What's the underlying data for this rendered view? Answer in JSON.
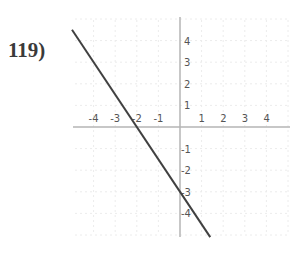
{
  "problem": {
    "number": "119)"
  },
  "chart_data": {
    "type": "line",
    "title": "",
    "xlabel": "",
    "ylabel": "",
    "xlim": [
      -4.5,
      5
    ],
    "ylim": [
      -5,
      5
    ],
    "grid": true,
    "x_ticks": [
      -4,
      -3,
      -2,
      -1,
      1,
      2,
      3,
      4
    ],
    "y_ticks": [
      4,
      3,
      2,
      1,
      -1,
      -2,
      -3,
      -4
    ],
    "series": [
      {
        "name": "line",
        "equation": "y = -1.5x - 3",
        "x": [
          -5,
          1.4
        ],
        "y": [
          4.5,
          -5.1
        ],
        "color": "#404040"
      }
    ],
    "annotations": {
      "x_intercept": -2,
      "y_intercept": -3
    }
  },
  "colors": {
    "axis": "#b4b4b4",
    "grid": "#ececec",
    "line": "#404040",
    "text": "#555555"
  }
}
